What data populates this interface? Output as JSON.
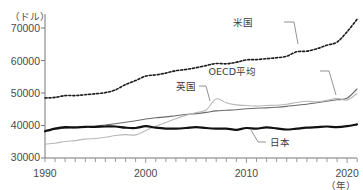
{
  "chart_data": {
    "type": "line",
    "title": "",
    "xlabel": "（年）",
    "ylabel": "（ドル）",
    "xlim": [
      1990,
      2021
    ],
    "ylim": [
      28500,
      76500
    ],
    "yticks": [
      30000,
      40000,
      50000,
      60000,
      70000
    ],
    "ytick_labels": [
      "30000",
      "40000",
      "50000",
      "60000",
      "70000"
    ],
    "xticks": [
      1990,
      2000,
      2010,
      2020
    ],
    "xtick_labels": [
      "1990",
      "2000",
      "2010",
      "2020"
    ],
    "minor_xtick_step": 1,
    "grid": false,
    "legend": "inline-annotations",
    "x": [
      1990,
      1991,
      1992,
      1993,
      1994,
      1995,
      1996,
      1997,
      1998,
      1999,
      2000,
      2001,
      2002,
      2003,
      2004,
      2005,
      2006,
      2007,
      2008,
      2009,
      2010,
      2011,
      2012,
      2013,
      2014,
      2015,
      2016,
      2017,
      2018,
      2019,
      2020,
      2021
    ],
    "series": [
      {
        "name": "米国",
        "style": "dotted",
        "color": "#1a1a1a",
        "values": [
          48500,
          48700,
          49300,
          49300,
          49600,
          49900,
          50300,
          51200,
          53000,
          54300,
          55800,
          56200,
          56800,
          57600,
          58000,
          58600,
          59300,
          60000,
          59900,
          60400,
          61200,
          61300,
          61600,
          61900,
          62400,
          63900,
          64100,
          64900,
          66100,
          67100,
          70500,
          74700
        ]
      },
      {
        "name": "OECD平均",
        "style": "solid",
        "color": "#6b6b6b",
        "values": [
          37700,
          38100,
          38400,
          38600,
          38800,
          39100,
          39500,
          39900,
          40400,
          40900,
          41500,
          41900,
          42200,
          42600,
          43000,
          43300,
          43700,
          44200,
          44400,
          44600,
          44900,
          45100,
          45200,
          45400,
          45700,
          46100,
          46400,
          46900,
          47400,
          47900,
          48400,
          51500
        ]
      },
      {
        "name": "英国",
        "style": "solid",
        "color": "#b8b8b8",
        "values": [
          33100,
          33400,
          34000,
          34300,
          34800,
          35000,
          35400,
          36000,
          36300,
          36200,
          37600,
          39100,
          40300,
          41600,
          42700,
          43600,
          44500,
          48200,
          46900,
          46200,
          46000,
          45800,
          46000,
          46100,
          46400,
          47000,
          47400,
          47200,
          47700,
          48400,
          47800,
          50000
        ]
      },
      {
        "name": "日本",
        "style": "solid-thick",
        "color": "#111111",
        "values": [
          37400,
          38300,
          38800,
          38700,
          38900,
          38900,
          39000,
          39000,
          38600,
          38500,
          39100,
          38600,
          38300,
          38300,
          38500,
          38800,
          38500,
          38300,
          38300,
          37900,
          38500,
          38300,
          38700,
          38400,
          38000,
          38300,
          38600,
          38800,
          39000,
          38800,
          39100,
          39700
        ]
      }
    ],
    "annotations": [
      {
        "label": "米国",
        "x": 253,
        "y": 23,
        "leader": {
          "x1": 284,
          "y1": 22,
          "x2": 298,
          "y2": 44
        }
      },
      {
        "label": "OECD平均",
        "x": 258,
        "y": 74,
        "leader": {
          "x1": 320,
          "y1": 72,
          "x2": 336,
          "y2": 93
        }
      },
      {
        "label": "英国",
        "x": 177,
        "y": 89,
        "leader": {
          "x1": 199,
          "y1": 88,
          "x2": 208,
          "y2": 100
        }
      },
      {
        "label": "日本",
        "x": 265,
        "y": 145,
        "leader": {
          "x1": 264,
          "y1": 142,
          "x2": 251,
          "y2": 128
        }
      }
    ]
  },
  "axes": {
    "y_unit_label": "（ドル）",
    "x_unit_label": "（年）"
  }
}
